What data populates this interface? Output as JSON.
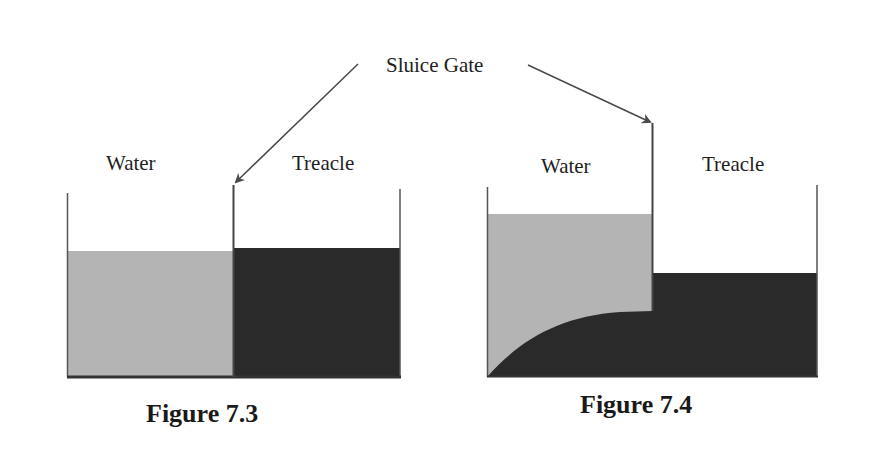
{
  "annotation": {
    "label": "Sluice Gate"
  },
  "figures": [
    {
      "caption": "Figure 7.3",
      "left_label": "Water",
      "right_label": "Treacle",
      "state": "before gate opens: equal levels"
    },
    {
      "caption": "Figure 7.4",
      "left_label": "Water",
      "right_label": "Treacle",
      "state": "after: treacle flows under water"
    }
  ],
  "colors": {
    "water": "#b4b4b4",
    "treacle": "#2a2a2a",
    "walls": "#555555",
    "arrow": "#4a4a4a",
    "background": "#ffffff"
  }
}
